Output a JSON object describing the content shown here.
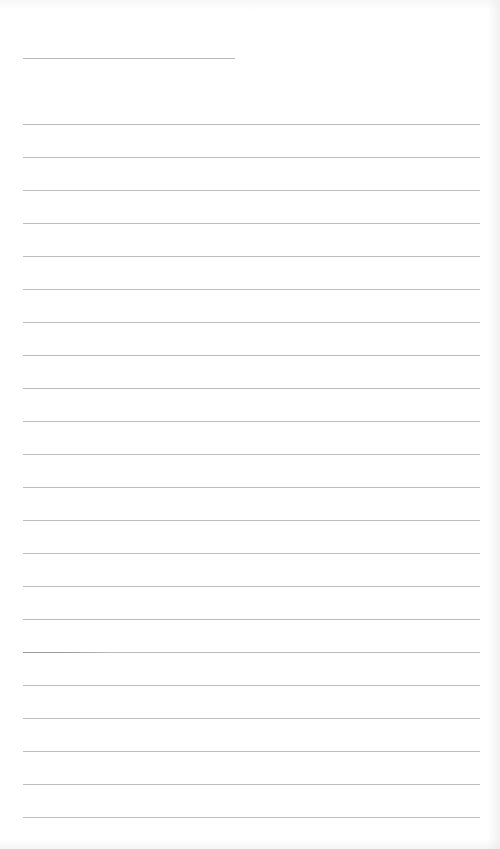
{
  "document": {
    "type": "lined-paper",
    "header_line": {
      "x": 23,
      "y": 58,
      "length": 212
    },
    "rule_lines": {
      "count": 22,
      "start_y": 124,
      "spacing": 33,
      "x_start": 23,
      "x_end": 480
    },
    "colors": {
      "paper": "#ffffff",
      "line": "#bdbdbd"
    },
    "text": []
  }
}
